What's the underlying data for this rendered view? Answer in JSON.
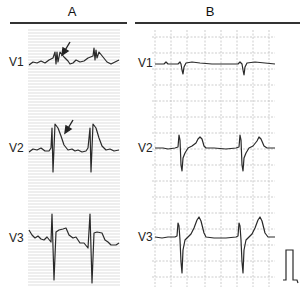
{
  "figure": {
    "panels": [
      {
        "id": "A",
        "title": "A",
        "leads": [
          {
            "label": "V1",
            "annotation": "arrow-pointing-to-ST-segment"
          },
          {
            "label": "V2",
            "annotation": "arrow-pointing-to-ST-segment"
          },
          {
            "label": "V3"
          }
        ],
        "grid": "fine-horizontal-lines"
      },
      {
        "id": "B",
        "title": "B",
        "leads": [
          {
            "label": "V1"
          },
          {
            "label": "V2"
          },
          {
            "label": "V3"
          }
        ],
        "grid": "square-grid",
        "calibration_pulse": true
      }
    ],
    "colors": {
      "trace": "#2a2a2a",
      "grid": "#b8b8b8",
      "rule": "#333333"
    }
  }
}
